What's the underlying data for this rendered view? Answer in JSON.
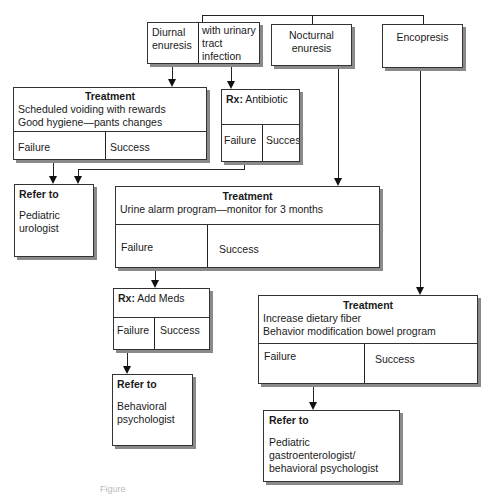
{
  "top": {
    "diurnal": "Diurnal enuresis",
    "uti": "with urinary tract infection",
    "nocturnal": "Nocturnal enuresis",
    "encopresis": "Encopresis"
  },
  "diurnal_treatment": {
    "title": "Treatment",
    "line1": "Scheduled voiding with rewards",
    "line2": "Good hygiene—pants changes",
    "failure": "Failure",
    "success": "Success"
  },
  "antibiotic": {
    "rx": "Rx:",
    "drug": " Antibiotic",
    "failure": "Failure",
    "success": "Success"
  },
  "refer_urologist": {
    "title": "Refer to",
    "line1": "Pediatric",
    "line2": "urologist"
  },
  "nocturnal_treatment": {
    "title": "Treatment",
    "line1": "Urine alarm program—monitor for 3 months",
    "failure": "Failure",
    "success": "Success"
  },
  "add_meds": {
    "rx": "Rx:",
    "drug": " Add Meds",
    "failure": "Failure",
    "success": "Success"
  },
  "refer_behavioral": {
    "title": "Refer to",
    "line1": "Behavioral",
    "line2": "psychologist"
  },
  "encopresis_treatment": {
    "title": "Treatment",
    "line1": "Increase dietary fiber",
    "line2": "Behavior modification bowel program",
    "failure": "Failure",
    "success": "Success"
  },
  "refer_gastro": {
    "title": "Refer to",
    "line1": "Pediatric gastroenterologist/",
    "line2": "behavioral psychologist"
  },
  "caption": "Figure"
}
